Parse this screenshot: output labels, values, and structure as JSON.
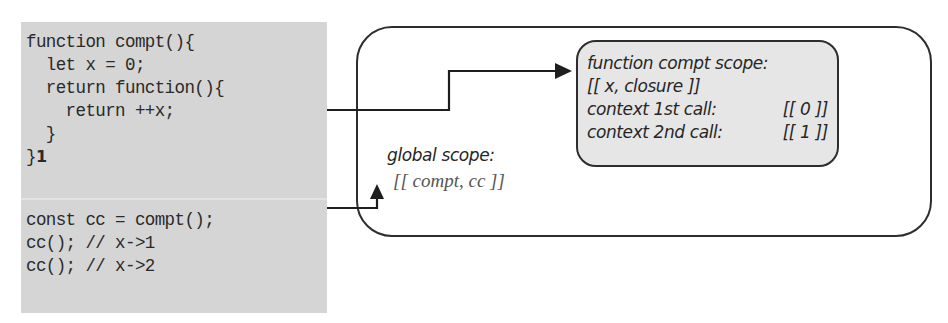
{
  "code_panel": {
    "background": "#d5d5d5",
    "function_block": [
      "function compt(){",
      "  let x = 0;",
      "  return function(){",
      "    return ++x;",
      "  }",
      "}"
    ],
    "function_block_marker": "1",
    "usage_block": [
      "const cc = compt();",
      "cc(); // x->1",
      "cc(); // x->2"
    ]
  },
  "global_scope": {
    "label": "global scope:",
    "variables": "[[ compt, cc ]]"
  },
  "function_scope": {
    "label": "function compt scope:",
    "variables": "[[ x, closure ]]",
    "contexts": [
      {
        "label": "context 1st call:",
        "value": "[[ 0 ]]"
      },
      {
        "label": "context 2nd call:",
        "value": "[[ 1 ]]"
      }
    ],
    "background": "#e6e6e6"
  },
  "connectors": [
    {
      "from": "function-block",
      "to": "function-compt-scope",
      "style": "arrow"
    },
    {
      "from": "usage-block",
      "to": "global-scope",
      "style": "arrow"
    }
  ]
}
